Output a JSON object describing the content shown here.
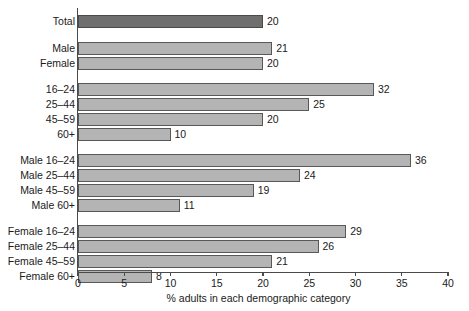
{
  "chart_data": {
    "type": "bar",
    "orientation": "horizontal",
    "title": "",
    "xlabel": "% adults in each demographic category",
    "ylabel": "",
    "xlim": [
      0,
      40
    ],
    "xticks": [
      0,
      5,
      10,
      15,
      20,
      25,
      30,
      35,
      40
    ],
    "grid": false,
    "legend": "none",
    "categories": [
      "Total",
      "Male",
      "Female",
      "16–24",
      "25–44",
      "45–59",
      "60+",
      "Male 16–24",
      "Male 25–44",
      "Male 45–59",
      "Male 60+",
      "Female 16–24",
      "Female 25–44",
      "Female 45–59",
      "Female 60+"
    ],
    "values": [
      20,
      21,
      20,
      32,
      25,
      20,
      10,
      36,
      24,
      19,
      11,
      29,
      26,
      21,
      8
    ],
    "data_labels": [
      "20",
      "21",
      "20",
      "32",
      "25",
      "20",
      "10",
      "36",
      "24",
      "19",
      "11",
      "29",
      "26",
      "21",
      "8"
    ],
    "groups": [
      {
        "name": "overall",
        "categories": [
          "Total"
        ]
      },
      {
        "name": "sex",
        "categories": [
          "Male",
          "Female"
        ]
      },
      {
        "name": "age",
        "categories": [
          "16–24",
          "25–44",
          "45–59",
          "60+"
        ]
      },
      {
        "name": "male-by-age",
        "categories": [
          "Male 16–24",
          "Male 25–44",
          "Male 45–59",
          "Male 60+"
        ]
      },
      {
        "name": "female-by-age",
        "categories": [
          "Female 16–24",
          "Female 25–44",
          "Female 45–59",
          "Female 60+"
        ]
      }
    ],
    "colors": {
      "total_bar": "#6f6f6f",
      "bar": "#b4b4b4",
      "bar_border": "#585858",
      "axis": "#4a4a4a",
      "text": "#1a1a1a",
      "background": "#ffffff"
    },
    "bars": [
      {
        "label": "Total",
        "value": 20,
        "value_label": "20",
        "y": 15,
        "highlight": true
      },
      {
        "label": "Male",
        "value": 21,
        "value_label": "21",
        "y": 42,
        "highlight": false
      },
      {
        "label": "Female",
        "value": 20,
        "value_label": "20",
        "y": 57,
        "highlight": false
      },
      {
        "label": "16–24",
        "value": 32,
        "value_label": "32",
        "y": 83,
        "highlight": false
      },
      {
        "label": "25–44",
        "value": 25,
        "value_label": "25",
        "y": 98,
        "highlight": false
      },
      {
        "label": "45–59",
        "value": 20,
        "value_label": "20",
        "y": 113,
        "highlight": false
      },
      {
        "label": "60+",
        "value": 10,
        "value_label": "10",
        "y": 128,
        "highlight": false
      },
      {
        "label": "Male 16–24",
        "value": 36,
        "value_label": "36",
        "y": 154,
        "highlight": false
      },
      {
        "label": "Male 25–44",
        "value": 24,
        "value_label": "24",
        "y": 169,
        "highlight": false
      },
      {
        "label": "Male 45–59",
        "value": 19,
        "value_label": "19",
        "y": 184,
        "highlight": false
      },
      {
        "label": "Male 60+",
        "value": 11,
        "value_label": "11",
        "y": 199,
        "highlight": false
      },
      {
        "label": "Female 16–24",
        "value": 29,
        "value_label": "29",
        "y": 225,
        "highlight": false
      },
      {
        "label": "Female 25–44",
        "value": 26,
        "value_label": "26",
        "y": 240,
        "highlight": false
      },
      {
        "label": "Female 45–59",
        "value": 21,
        "value_label": "21",
        "y": 255,
        "highlight": false
      },
      {
        "label": "Female 60+",
        "value": 8,
        "value_label": "8",
        "y": 270,
        "highlight": false
      }
    ]
  }
}
